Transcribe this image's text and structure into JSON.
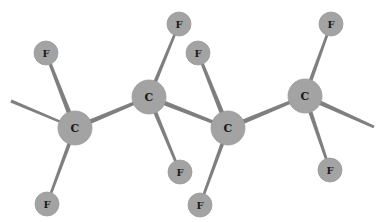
{
  "diagram": {
    "type": "ball-and-stick molecular model",
    "molecule": "polytetrafluoroethylene chain segment",
    "colors": {
      "atom_fill": "#a3a3a3",
      "atom_edge": "#9a9a9a",
      "bond": "#7f7f7f",
      "label": "#1a1a1a",
      "background": "#ffffff"
    },
    "atoms": [
      {
        "id": "C1",
        "label": "C",
        "x": 75,
        "y": 128,
        "r": 17
      },
      {
        "id": "C2",
        "label": "C",
        "x": 149,
        "y": 97,
        "r": 17
      },
      {
        "id": "C3",
        "label": "C",
        "x": 228,
        "y": 128,
        "r": 17
      },
      {
        "id": "C4",
        "label": "C",
        "x": 305,
        "y": 96,
        "r": 17
      },
      {
        "id": "F1",
        "label": "F",
        "x": 46,
        "y": 53,
        "r": 12
      },
      {
        "id": "F2",
        "label": "F",
        "x": 47,
        "y": 204,
        "r": 12
      },
      {
        "id": "F3",
        "label": "F",
        "x": 179,
        "y": 24,
        "r": 12
      },
      {
        "id": "F4",
        "label": "F",
        "x": 198,
        "y": 53,
        "r": 12
      },
      {
        "id": "F5",
        "label": "F",
        "x": 180,
        "y": 172,
        "r": 12
      },
      {
        "id": "F6",
        "label": "F",
        "x": 200,
        "y": 205,
        "r": 12
      },
      {
        "id": "F7",
        "label": "F",
        "x": 331,
        "y": 24,
        "r": 12
      },
      {
        "id": "F8",
        "label": "F",
        "x": 330,
        "y": 170,
        "r": 12
      }
    ],
    "bonds": [
      {
        "x1": 11,
        "y1": 101,
        "x2": 75,
        "y2": 128,
        "w": 3.5
      },
      {
        "x1": 75,
        "y1": 128,
        "x2": 149,
        "y2": 97,
        "w": 5
      },
      {
        "x1": 149,
        "y1": 97,
        "x2": 228,
        "y2": 128,
        "w": 5
      },
      {
        "x1": 228,
        "y1": 128,
        "x2": 305,
        "y2": 96,
        "w": 5
      },
      {
        "x1": 305,
        "y1": 96,
        "x2": 374,
        "y2": 127,
        "w": 5
      },
      {
        "x1": 75,
        "y1": 128,
        "x2": 46,
        "y2": 53,
        "w": 5
      },
      {
        "x1": 75,
        "y1": 128,
        "x2": 47,
        "y2": 204,
        "w": 4
      },
      {
        "x1": 149,
        "y1": 97,
        "x2": 179,
        "y2": 24,
        "w": 4
      },
      {
        "x1": 149,
        "y1": 97,
        "x2": 180,
        "y2": 172,
        "w": 4.5
      },
      {
        "x1": 228,
        "y1": 128,
        "x2": 198,
        "y2": 53,
        "w": 5
      },
      {
        "x1": 228,
        "y1": 128,
        "x2": 200,
        "y2": 205,
        "w": 4
      },
      {
        "x1": 305,
        "y1": 96,
        "x2": 331,
        "y2": 24,
        "w": 4
      },
      {
        "x1": 305,
        "y1": 96,
        "x2": 330,
        "y2": 170,
        "w": 4.5
      }
    ]
  }
}
